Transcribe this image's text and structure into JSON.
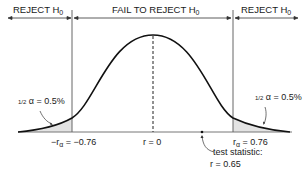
{
  "diagram": {
    "type": "two-tailed hypothesis test on correlation coefficient",
    "regions": [
      {
        "label": "REJECT H",
        "subscript": "0",
        "side": "left"
      },
      {
        "label": "FAIL TO REJECT H",
        "subscript": "0",
        "side": "center"
      },
      {
        "label": "REJECT H",
        "subscript": "0",
        "side": "right"
      }
    ],
    "tails": {
      "left": {
        "fraction": "1/2",
        "text": "α = 0.5%"
      },
      "right": {
        "fraction": "1/2",
        "text": "α = 0.5%"
      }
    },
    "axis_labels": {
      "left_critical_prefix": "−r",
      "left_critical_sub": "α",
      "left_critical_value": " = −0.76",
      "center": "r = 0",
      "right_critical_prefix": "r",
      "right_critical_sub": "α",
      "right_critical_value": " = 0.76"
    },
    "test_statistic": {
      "line1": "test statistic:",
      "line2": "r = 0.65"
    },
    "colors": {
      "curve": "#111111",
      "tail_fill": "#e3e3e3",
      "axis": "#777777"
    }
  }
}
